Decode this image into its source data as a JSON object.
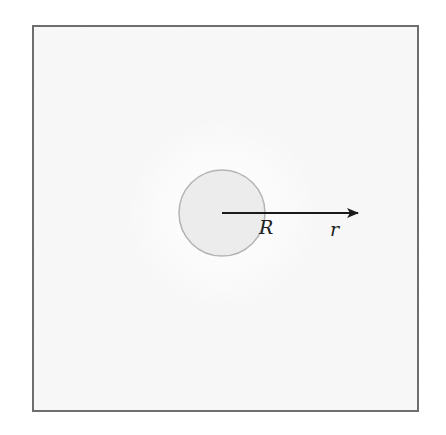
{
  "diagram": {
    "labels": {
      "inner_radius": "R",
      "radial_coordinate": "r"
    },
    "colors": {
      "frame": "#6e6e6e",
      "background": "#fafafa",
      "sphere_fill": "#ececec",
      "sphere_stroke": "#b4b4b4",
      "arrow": "#1a1a1a"
    }
  }
}
